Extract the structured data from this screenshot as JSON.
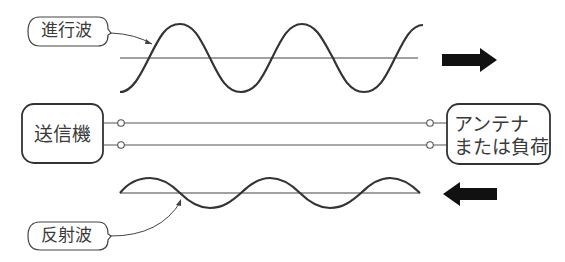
{
  "diagram": {
    "labels": {
      "forward_wave": "進行波",
      "reflected_wave": "反射波",
      "transmitter": "送信機",
      "load_line1": "アンテナ",
      "load_line2": "または負荷"
    },
    "arrows": {
      "forward_direction": "right",
      "reflected_direction": "left"
    },
    "colors": {
      "line": "#333333",
      "arrow": "#111111",
      "background": "#ffffff"
    },
    "caption": ""
  }
}
